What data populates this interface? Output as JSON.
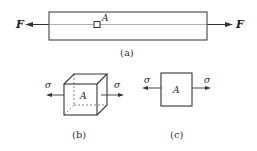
{
  "figure": {
    "panel_a": {
      "caption": "(a)",
      "force_left_label": "F",
      "force_right_label": "F",
      "point_label": "A"
    },
    "panel_b": {
      "caption": "(b)",
      "stress_left_label": "σ",
      "stress_right_label": "σ",
      "element_label": "A"
    },
    "panel_c": {
      "caption": "(c)",
      "stress_left_label": "σ",
      "stress_right_label": "σ",
      "element_label": "A"
    },
    "colors": {
      "line": "#333333",
      "thin_line": "#888888"
    }
  }
}
